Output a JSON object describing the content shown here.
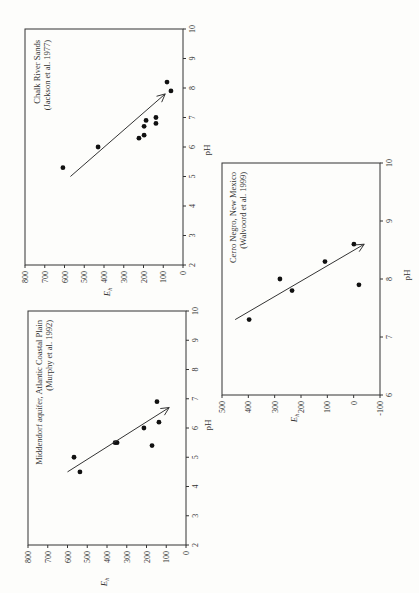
{
  "chart_data": [
    {
      "type": "scatter",
      "title": "Chalk River Sands",
      "subtitle": "(Jackson et al. 1977)",
      "xlabel": "pH",
      "ylabel": "Eh",
      "xlim": [
        2,
        10
      ],
      "ylim": [
        0,
        800
      ],
      "xticks": [
        "2",
        "3",
        "4",
        "5",
        "6",
        "7",
        "8",
        "9",
        "10"
      ],
      "yticks": [
        "0",
        "100",
        "200",
        "300",
        "400",
        "500",
        "600",
        "700",
        "800"
      ],
      "grid": false,
      "rotated_90": true,
      "points": [
        {
          "pH": 5.3,
          "Eh": 608
        },
        {
          "pH": 6.0,
          "Eh": 430
        },
        {
          "pH": 6.3,
          "Eh": 223
        },
        {
          "pH": 6.4,
          "Eh": 197
        },
        {
          "pH": 6.7,
          "Eh": 197
        },
        {
          "pH": 6.9,
          "Eh": 187
        },
        {
          "pH": 6.8,
          "Eh": 137
        },
        {
          "pH": 7.0,
          "Eh": 137
        },
        {
          "pH": 8.2,
          "Eh": 81
        },
        {
          "pH": 7.9,
          "Eh": 61
        }
      ],
      "trend_arrow": {
        "from": {
          "pH": 5.0,
          "Eh": 570
        },
        "to": {
          "pH": 7.8,
          "Eh": 90
        }
      }
    },
    {
      "type": "scatter",
      "title": "Middendorf aquifer, Atlantic Coastal Plain",
      "subtitle": "(Murphy et al. 1992)",
      "xlabel": "pH",
      "ylabel": "Eh",
      "xlim": [
        2,
        10
      ],
      "ylim": [
        0,
        800
      ],
      "xticks": [
        "2",
        "3",
        "4",
        "5",
        "6",
        "7",
        "8",
        "9",
        "10"
      ],
      "yticks": [
        "0",
        "100",
        "200",
        "300",
        "400",
        "500",
        "600",
        "700",
        "800"
      ],
      "grid": false,
      "rotated_90": true,
      "points": [
        {
          "pH": 5.0,
          "Eh": 567
        },
        {
          "pH": 4.5,
          "Eh": 537
        },
        {
          "pH": 5.5,
          "Eh": 359
        },
        {
          "pH": 5.5,
          "Eh": 349
        },
        {
          "pH": 6.0,
          "Eh": 213
        },
        {
          "pH": 5.4,
          "Eh": 172
        },
        {
          "pH": 6.9,
          "Eh": 147
        },
        {
          "pH": 6.2,
          "Eh": 137
        }
      ],
      "trend_arrow": {
        "from": {
          "pH": 4.5,
          "Eh": 600
        },
        "to": {
          "pH": 6.7,
          "Eh": 85
        }
      }
    },
    {
      "type": "scatter",
      "title": "Cerro Negro, New Mexico",
      "subtitle": "(Walvoord et al. 1999)",
      "xlabel": "pH",
      "ylabel": "Eh",
      "xlim": [
        6,
        10
      ],
      "ylim": [
        -100,
        500
      ],
      "xticks": [
        "6",
        "7",
        "8",
        "9",
        "10"
      ],
      "yticks": [
        "-100",
        "0",
        "100",
        "200",
        "300",
        "400",
        "500"
      ],
      "grid": false,
      "rotated_90": true,
      "points": [
        {
          "pH": 7.3,
          "Eh": 397
        },
        {
          "pH": 8.0,
          "Eh": 280
        },
        {
          "pH": 7.8,
          "Eh": 234
        },
        {
          "pH": 8.3,
          "Eh": 109
        },
        {
          "pH": 8.6,
          "Eh": -1
        },
        {
          "pH": 7.9,
          "Eh": -20
        }
      ],
      "trend_arrow": {
        "from": {
          "pH": 7.3,
          "Eh": 450
        },
        "to": {
          "pH": 8.6,
          "Eh": -40
        }
      }
    }
  ]
}
